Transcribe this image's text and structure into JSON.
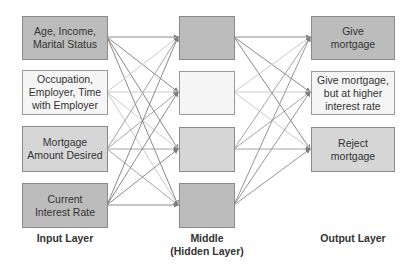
{
  "diagram": {
    "input_layer": {
      "label": "Input Layer",
      "nodes": [
        {
          "line1": "Age, Income,",
          "line2": "Marital Status",
          "line3": ""
        },
        {
          "line1": "Occupation,",
          "line2": "Employer, Time",
          "line3": "with Employer"
        },
        {
          "line1": "Mortgage",
          "line2": "Amount Desired",
          "line3": ""
        },
        {
          "line1": "Current",
          "line2": "Interest Rate",
          "line3": ""
        }
      ]
    },
    "hidden_layer": {
      "label_line1": "Middle",
      "label_line2": "(Hidden Layer)",
      "node_count": 4
    },
    "output_layer": {
      "label": "Output Layer",
      "nodes": [
        {
          "line1": "Give",
          "line2": "mortgage",
          "line3": ""
        },
        {
          "line1": "Give mortgage,",
          "line2": "but at higher",
          "line3": "interest rate"
        },
        {
          "line1": "Reject",
          "line2": "mortgage",
          "line3": ""
        }
      ]
    },
    "colors": {
      "dark_fill": "#bcbcbc",
      "mid_fill": "#d6d6d6",
      "light_fill": "#f5f5f5",
      "dark_edge": "#7d7d7d",
      "light_edge": "#c4c4c4"
    }
  }
}
